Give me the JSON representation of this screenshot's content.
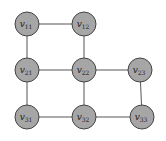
{
  "diagram": {
    "type": "graph",
    "colors": {
      "node_fill": "#a6a6a6",
      "node_stroke": "#444444",
      "edge": "#555555",
      "label": "#222222"
    },
    "nodes": [
      {
        "id": "v11",
        "base": "v",
        "sub": "11",
        "x": 27,
        "y": 24
      },
      {
        "id": "v12",
        "base": "v",
        "sub": "12",
        "x": 84,
        "y": 24
      },
      {
        "id": "v21",
        "base": "v",
        "sub": "21",
        "x": 27,
        "y": 70
      },
      {
        "id": "v22",
        "base": "v",
        "sub": "22",
        "x": 84,
        "y": 70
      },
      {
        "id": "v23",
        "base": "v",
        "sub": "23",
        "x": 140,
        "y": 70
      },
      {
        "id": "v31",
        "base": "v",
        "sub": "31",
        "x": 27,
        "y": 117
      },
      {
        "id": "v32",
        "base": "v",
        "sub": "32",
        "x": 84,
        "y": 117
      },
      {
        "id": "v33",
        "base": "v",
        "sub": "33",
        "x": 142,
        "y": 117
      }
    ],
    "edges": [
      [
        "v11",
        "v12"
      ],
      [
        "v11",
        "v21"
      ],
      [
        "v12",
        "v22"
      ],
      [
        "v21",
        "v22"
      ],
      [
        "v22",
        "v23"
      ],
      [
        "v21",
        "v31"
      ],
      [
        "v22",
        "v32"
      ],
      [
        "v23",
        "v33"
      ],
      [
        "v31",
        "v32"
      ],
      [
        "v32",
        "v33"
      ]
    ],
    "node_radius": 12
  }
}
